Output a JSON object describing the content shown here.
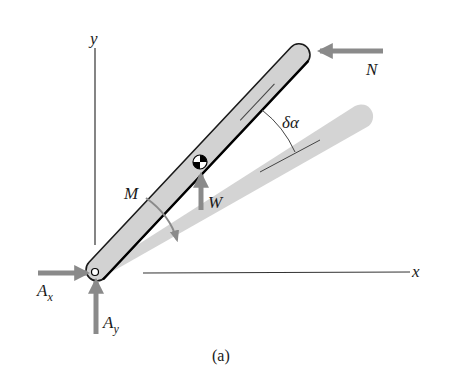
{
  "figure": {
    "caption": "(a)"
  },
  "axes": {
    "x_label": "x",
    "y_label": "y"
  },
  "forces": {
    "N": {
      "label": "N",
      "direction": "left"
    },
    "W": {
      "label": "W",
      "direction": "up"
    },
    "Ax": {
      "label": "A",
      "subscript": "x",
      "direction": "right"
    },
    "Ay": {
      "label": "A",
      "subscript": "y",
      "direction": "up"
    }
  },
  "moment": {
    "label": "M",
    "direction": "clockwise"
  },
  "angle": {
    "label": "δα"
  },
  "colors": {
    "bar_fill": "#d2d2d2",
    "bar_outline": "#1a1a1a",
    "displaced_bar_fill": "#d4d4d4",
    "arrow": "#8a8a8a",
    "axis": "#333333"
  }
}
